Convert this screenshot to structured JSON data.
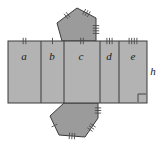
{
  "diagram": {
    "colors": {
      "rect_fill": "#b3b3b3",
      "pentagon_fill": "#9b9b9b",
      "stroke": "#3a3a3a",
      "tick": "#4a4a4a",
      "label": "#1a1a1a",
      "background": "#ffffff"
    },
    "strip": {
      "x_left": 8,
      "x_right": 147,
      "y_top": 41,
      "y_bottom": 103,
      "dividers": [
        41,
        64,
        100,
        119
      ]
    },
    "panels": [
      {
        "label": "a",
        "ticks": 2,
        "x_start": 8,
        "x_end": 41,
        "cx": 24,
        "cy": 60
      },
      {
        "label": "b",
        "ticks": 1,
        "x_start": 41,
        "x_end": 64,
        "cx": 52,
        "cy": 60
      },
      {
        "label": "c",
        "ticks": 2,
        "x_start": 64,
        "x_end": 100,
        "cx": 81,
        "cy": 60
      },
      {
        "label": "d",
        "ticks": 3,
        "x_start": 100,
        "x_end": 119,
        "cx": 109,
        "cy": 60
      },
      {
        "label": "e",
        "ticks": 4,
        "x_start": 119,
        "x_end": 147,
        "cx": 133,
        "cy": 60
      }
    ],
    "height_label": {
      "text": "h",
      "x": 153,
      "y": 75
    },
    "right_angle_marker": {
      "x": 138,
      "y": 94,
      "size": 8
    },
    "top_pentagon": {
      "points": "62,41 57,23 77,8 96,18 96,41",
      "tick_edges": [
        {
          "ticks": 2,
          "x1": 57,
          "y1": 23,
          "x2": 77,
          "y2": 8
        },
        {
          "ticks": 3,
          "x1": 77,
          "y1": 8,
          "x2": 96,
          "y2": 18
        },
        {
          "ticks": 4,
          "x1": 96,
          "y1": 18,
          "x2": 96,
          "y2": 41
        }
      ]
    },
    "bottom_pentagon": {
      "points": "64,103 50,116 59,135 85,137 98,118 98,103",
      "tick_edges": [
        {
          "ticks": 1,
          "x1": 50,
          "y1": 116,
          "x2": 59,
          "y2": 135
        },
        {
          "ticks": 3,
          "x1": 59,
          "y1": 135,
          "x2": 85,
          "y2": 137
        },
        {
          "ticks": 3,
          "x1": 85,
          "y1": 137,
          "x2": 98,
          "y2": 118
        },
        {
          "ticks": 3,
          "x1": 98,
          "y1": 118,
          "x2": 98,
          "y2": 103
        }
      ]
    }
  }
}
